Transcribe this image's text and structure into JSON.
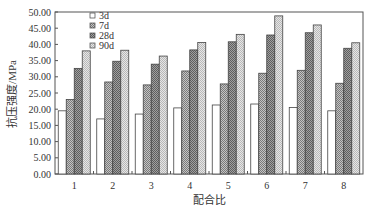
{
  "chart_data": {
    "type": "bar",
    "title": "",
    "xlabel": "配合比",
    "ylabel": "抗压强度/MPa",
    "ylim": [
      0,
      50
    ],
    "yticks": [
      "0.00",
      "5.00",
      "10.00",
      "15.00",
      "20.00",
      "25.00",
      "30.00",
      "35.00",
      "40.00",
      "45.00",
      "50.00"
    ],
    "categories": [
      "1",
      "2",
      "3",
      "4",
      "5",
      "6",
      "7",
      "8"
    ],
    "grid": false,
    "legend_position": "upper-left-inside",
    "series": [
      {
        "name": "3d",
        "fill": "#ffffff",
        "pattern": "none",
        "values": [
          19.5,
          17.0,
          18.5,
          20.4,
          21.3,
          21.6,
          20.5,
          19.5
        ]
      },
      {
        "name": "7d",
        "fill": "#a8a8a8",
        "pattern": "checker-mid",
        "values": [
          23.0,
          28.4,
          27.5,
          31.8,
          27.8,
          31.1,
          32.0,
          28.0
        ]
      },
      {
        "name": "28d",
        "fill": "#8c8c8c",
        "pattern": "checker-dark",
        "values": [
          32.6,
          34.8,
          33.9,
          38.3,
          40.8,
          42.9,
          43.6,
          38.8
        ]
      },
      {
        "name": "90d",
        "fill": "#d2d2d2",
        "pattern": "checker-light",
        "values": [
          38.0,
          38.2,
          36.4,
          40.6,
          43.1,
          48.8,
          46.0,
          40.5
        ]
      }
    ]
  },
  "labels": {
    "xlabel": "配合比",
    "ylabel": "抗压强度/MPa"
  }
}
